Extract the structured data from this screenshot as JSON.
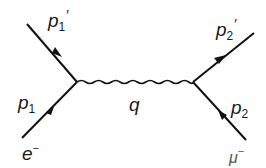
{
  "diagram": {
    "type": "feynman-diagram",
    "particles": {
      "incoming_left": {
        "symbol": "e",
        "charge": "−"
      },
      "incoming_right": {
        "symbol": "μ",
        "charge": "−"
      }
    },
    "momenta": {
      "p1": {
        "base": "p",
        "sub": "1",
        "prime": ""
      },
      "p1_prime": {
        "base": "p",
        "sub": "1",
        "prime": "′"
      },
      "p2": {
        "base": "p",
        "sub": "2",
        "prime": ""
      },
      "p2_prime": {
        "base": "p",
        "sub": "2",
        "prime": "′"
      },
      "q": "q"
    },
    "colors": {
      "line": "#111111",
      "text": "#1a1a1a"
    }
  }
}
